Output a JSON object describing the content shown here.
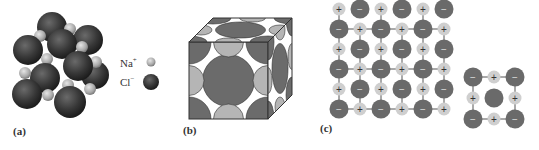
{
  "figure": {
    "panels": [
      {
        "id": "a",
        "label": "(a)",
        "description": "Space-filling model of NaCl crystal lattice"
      },
      {
        "id": "b",
        "label": "(b)",
        "description": "Unit cell cube cutaway showing ion packing"
      },
      {
        "id": "c",
        "label": "(c)",
        "description": "2D lattice of alternating cations and anions"
      }
    ],
    "legend": {
      "na_label": "Na",
      "na_charge": "+",
      "cl_label": "Cl",
      "cl_charge": "−"
    },
    "symbols": {
      "plus": "+",
      "minus": "−"
    },
    "colors": {
      "anion_dark": "#3a3a3a",
      "anion_gray": "#6a6a6a",
      "cation_light": "#bdbdbd",
      "cation_pale": "#cfcfcf",
      "line": "#555555"
    }
  }
}
